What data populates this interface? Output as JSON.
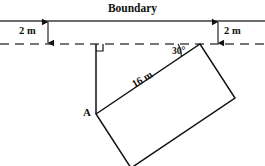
{
  "diagram": {
    "title": "Boundary",
    "labels": {
      "dimension_left": "2 m",
      "dimension_right": "2 m",
      "angle": "30°",
      "point_a": "A",
      "side_length": "16 m"
    },
    "geometry": {
      "boundary_line": {
        "y": 21,
        "x1": 0,
        "x2": 265,
        "style": "solid"
      },
      "offset_line": {
        "y": 44,
        "x1": 0,
        "x2": 265,
        "style": "dashed"
      },
      "offset_distance": "2 m",
      "dimension_arrow_left_x": 48,
      "dimension_arrow_right_x": 218,
      "perpendicular_foot": {
        "x": 96,
        "y": 44
      },
      "right_angle_marker": {
        "x": 96,
        "y": 44,
        "size": 7
      },
      "rectangle_vertices": [
        {
          "name": "A",
          "x": 96,
          "y": 114
        },
        {
          "name": "top-right",
          "x": 200,
          "y": 44
        },
        {
          "name": "right",
          "x": 235,
          "y": 98
        },
        {
          "name": "bottom",
          "x": 131,
          "y": 168
        }
      ],
      "angle_at_top_right": "30°",
      "labelled_side": {
        "from": "A",
        "to": "top-right",
        "length": "16 m"
      }
    }
  }
}
